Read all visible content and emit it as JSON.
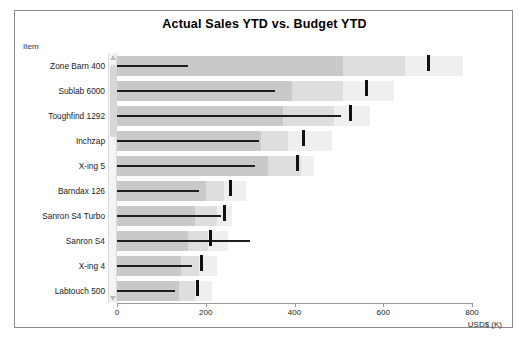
{
  "chart": {
    "title": "Actual Sales YTD  vs. Budget YTD",
    "item_header": "Item",
    "axis_title": "USD$ (K)"
  },
  "chart_data": {
    "type": "bar",
    "subtype": "bullet",
    "title": "Actual Sales YTD  vs. Budget YTD",
    "xlabel": "USD$ (K)",
    "ylabel": "Item",
    "xlim": [
      0,
      800
    ],
    "ticks": [
      0,
      200,
      400,
      600,
      800
    ],
    "tick_labels": [
      "0",
      "200",
      "400",
      "600",
      "800"
    ],
    "grid": false,
    "legend": "none",
    "categories": [
      "Zone Barn 400",
      "Sublab 6000",
      "Toughfind 1292",
      "Inchzap",
      "X-ing 5",
      "Barndax 126",
      "Sanron S4 Turbo",
      "Sanron S4",
      "X-ing 4",
      "Labtouch 500"
    ],
    "series": [
      {
        "name": "Actual Sales YTD",
        "values": [
          160,
          355,
          505,
          320,
          310,
          185,
          235,
          300,
          170,
          130
        ]
      },
      {
        "name": "Budget YTD",
        "values": [
          700,
          560,
          525,
          420,
          405,
          255,
          240,
          210,
          190,
          180
        ]
      }
    ],
    "qualitative_ranges": [
      [
        510,
        650,
        780
      ],
      [
        395,
        510,
        625
      ],
      [
        375,
        490,
        570
      ],
      [
        325,
        385,
        485
      ],
      [
        340,
        415,
        445
      ],
      [
        200,
        240,
        290
      ],
      [
        175,
        225,
        260
      ],
      [
        160,
        205,
        250
      ],
      [
        145,
        185,
        225
      ],
      [
        140,
        175,
        215
      ]
    ]
  },
  "rows": [
    {
      "label": "Zone Barn 400"
    },
    {
      "label": "Sublab 6000"
    },
    {
      "label": "Toughfind 1292"
    },
    {
      "label": "Inchzap"
    },
    {
      "label": "X-ing 5"
    },
    {
      "label": "Barndax 126"
    },
    {
      "label": "Sanron S4 Turbo"
    },
    {
      "label": "Sanron S4"
    },
    {
      "label": "X-ing 4"
    },
    {
      "label": "Labtouch 500"
    }
  ],
  "colors": {
    "band_dark": "#c9c9c9",
    "band_mid": "#dedede",
    "band_light": "#efefef",
    "measure": "#1f1f1f",
    "target": "#111111",
    "border": "#8a8a8a"
  },
  "scrollbar": {
    "up_arrow": "triangle-up-icon",
    "down_arrow": "triangle-down-icon"
  }
}
